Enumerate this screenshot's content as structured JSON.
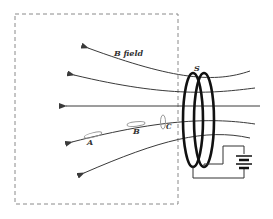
{
  "diagram": {
    "labels": {
      "b_field": "B field",
      "coil": "S",
      "loop_a": "A",
      "loop_b": "B",
      "loop_c": "C"
    },
    "colors": {
      "line": "#3a3a3a",
      "coil": "#111111",
      "dashed_box": "#8a8a8a",
      "loop": "#9a9a9a"
    }
  }
}
